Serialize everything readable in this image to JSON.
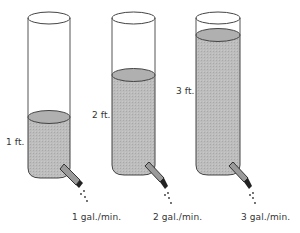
{
  "diagram": {
    "colors": {
      "water": "#b9b9b9",
      "outline": "#444444",
      "background": "#ffffff"
    },
    "cylinders": [
      {
        "height_label": "1 ft.",
        "flow_label": "1 gal./min."
      },
      {
        "height_label": "2 ft.",
        "flow_label": "2 gal./min."
      },
      {
        "height_label": "3 ft.",
        "flow_label": "3 gal./min."
      }
    ]
  }
}
